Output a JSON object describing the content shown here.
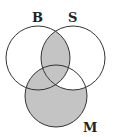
{
  "diagram": {
    "type": "venn",
    "sets": [
      {
        "label": "B",
        "cx": 38,
        "cy": 58,
        "r": 32
      },
      {
        "label": "S",
        "cx": 73,
        "cy": 58,
        "r": 32
      },
      {
        "label": "M",
        "cx": 56,
        "cy": 96,
        "r": 31
      }
    ],
    "shaded_regions": [
      "B∩S",
      "M−S"
    ],
    "shade_color": "#c4c4c4",
    "stroke_color": "#333333",
    "labels": {
      "b": "B",
      "s": "S",
      "m": "M"
    }
  }
}
